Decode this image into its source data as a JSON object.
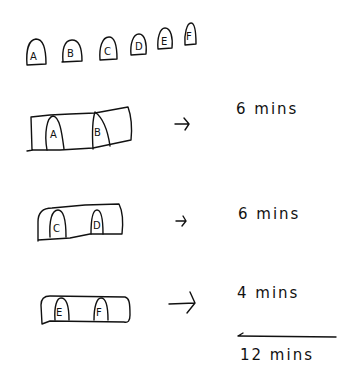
{
  "diagram": {
    "title": "",
    "pieces": [
      "A",
      "B",
      "C",
      "D",
      "E",
      "F"
    ],
    "steps": [
      {
        "pair": [
          "A",
          "B"
        ],
        "arrow": "→",
        "time": "6 mins"
      },
      {
        "pair": [
          "C",
          "D"
        ],
        "arrow": "→",
        "time": "6 mins"
      },
      {
        "pair": [
          "E",
          "F"
        ],
        "arrow": "→",
        "time": "4 mins"
      }
    ],
    "total": "12 mins",
    "ink_color": "#111111"
  }
}
